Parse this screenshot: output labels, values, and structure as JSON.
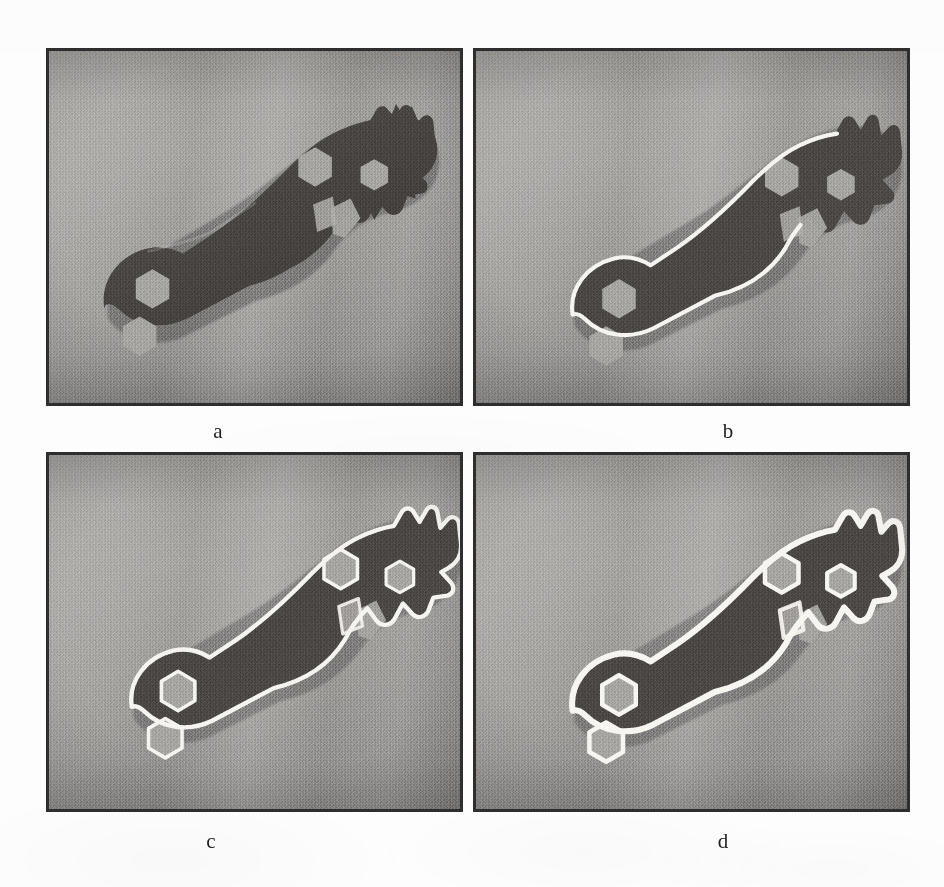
{
  "figure": {
    "kind": "image-processing-result-grid",
    "background_color": "#fdfdfd",
    "panel_border_color": "#2e2e2e",
    "panel_background_color": "#9e9e9e",
    "object_color": "#4a4745",
    "contour_color": "#f5f3ef",
    "rows": 2,
    "columns": 2,
    "panels": [
      {
        "id": "panel-a",
        "caption": "a",
        "content": "grayscale photograph of a bicycle-chain style hexagonal spanner tool lying on a uniform gray cloth background",
        "contour": "none",
        "x": 46,
        "y": 48,
        "width": 417,
        "height": 358
      },
      {
        "id": "panel-b",
        "caption": "b",
        "content": "same spanner photograph with a partial white boundary curve traced along part of the upper-left and lower outline",
        "contour": "partial-outer",
        "x": 473,
        "y": 48,
        "width": 437,
        "height": 358
      },
      {
        "id": "panel-c",
        "caption": "c",
        "content": "same spanner photograph with a complete white contour traced around the full outer silhouette and the hexagonal holes",
        "contour": "full-outer-plus-holes",
        "x": 46,
        "y": 452,
        "width": 417,
        "height": 360
      },
      {
        "id": "panel-d",
        "caption": "d",
        "content": "same spanner photograph with a thicker, smoother white contour enclosing the outer silhouette and the hexagonal holes",
        "contour": "full-outer-plus-holes-thick",
        "x": 473,
        "y": 452,
        "width": 437,
        "height": 360
      }
    ],
    "captions": [
      {
        "label": "a",
        "x": 218,
        "y": 432
      },
      {
        "label": "b",
        "x": 728,
        "y": 432
      },
      {
        "label": "c",
        "x": 211,
        "y": 842
      },
      {
        "label": "d",
        "x": 723,
        "y": 842
      }
    ]
  }
}
